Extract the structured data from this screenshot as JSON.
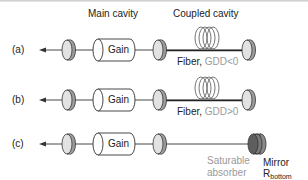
{
  "headers": {
    "main_cavity": "Main cavity",
    "coupled_cavity": "Coupled cavity"
  },
  "rows": [
    {
      "label": "(a)",
      "gain_label": "Gain",
      "fiber_label": "Fiber,",
      "fiber_gdd": "GDD<0"
    },
    {
      "label": "(b)",
      "gain_label": "Gain",
      "fiber_label": "Fiber,",
      "fiber_gdd": "GDD>0"
    },
    {
      "label": "(c)",
      "gain_label": "Gain",
      "absorber_line1": "Saturable",
      "absorber_line2": "absorber",
      "mirror_line1": "Mirror",
      "mirror_base": "R",
      "mirror_sub": "bottom"
    }
  ],
  "colors": {
    "line": "#333333",
    "mirror_fill": "#b8b8b8",
    "mirror_face": "#e6e6e6",
    "gdd_text": "#9a9a9a",
    "absorber_text": "#9a9a9a",
    "coil": "#555555"
  }
}
